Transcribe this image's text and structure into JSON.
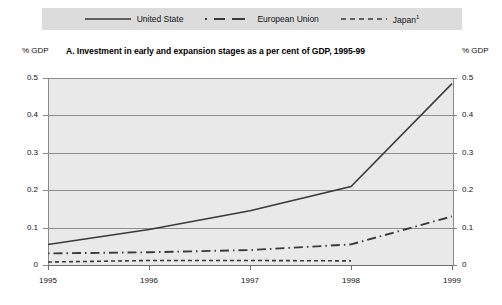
{
  "legend": {
    "items": [
      {
        "label": "United State",
        "style": "solid",
        "icon": "solid-line-icon"
      },
      {
        "label": "European Union",
        "style": "dash-dot",
        "icon": "dashed-line-icon"
      },
      {
        "label": "Japan",
        "footnote": "1",
        "style": "fine-dash",
        "icon": "fine-dashed-line-icon"
      }
    ]
  },
  "axis_unit_left": "% GDP",
  "axis_unit_right": "% GDP",
  "title": "A. Investment in early and expansion stages as a per cent of GDP, 1995-99",
  "colors": {
    "plot_background": "#e9e9e9",
    "legend_background": "#dcdcdc",
    "gridline": "#8d8d8d",
    "series_line": "#3a3a3a",
    "text": "#111111"
  },
  "chart_data": {
    "type": "line",
    "title": "A. Investment in early and expansion stages as a per cent of GDP, 1995-99",
    "xlabel": "",
    "ylabel": "% GDP",
    "ylabel_right": "% GDP",
    "x": [
      "1995",
      "1996",
      "1997",
      "1998",
      "1999"
    ],
    "xtick_labels": [
      "1995",
      "1996",
      "1997",
      "1998",
      "1999"
    ],
    "ytick_labels": [
      "0",
      "0.1",
      "0.2",
      "0.3",
      "0.4",
      "0.5"
    ],
    "ytick_values": [
      0,
      0.1,
      0.2,
      0.3,
      0.4,
      0.5
    ],
    "ylim": [
      0,
      0.5
    ],
    "grid": true,
    "legend_position": "top",
    "series": [
      {
        "name": "United State",
        "style": "solid",
        "values": [
          0.055,
          0.095,
          0.145,
          0.21,
          0.485
        ]
      },
      {
        "name": "European Union",
        "style": "dash-dot",
        "values": [
          0.031,
          0.034,
          0.04,
          0.055,
          0.13
        ]
      },
      {
        "name": "Japan",
        "style": "fine-dash",
        "values": [
          0.008,
          0.012,
          0.012,
          0.011,
          null
        ]
      }
    ]
  }
}
